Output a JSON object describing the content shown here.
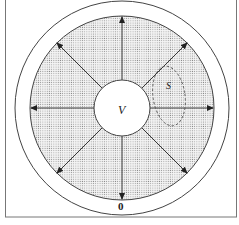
{
  "diagram": {
    "type": "concentric-circle-flux-diagram",
    "labels": {
      "inner_volume": "V",
      "surface": "S",
      "outer_boundary": "0"
    },
    "colors": {
      "stroke": "#333333",
      "shading_dot": "#888888",
      "background": "#ffffff",
      "frame": "#777777"
    },
    "arrows": {
      "count": 8,
      "directions_deg": [
        0,
        45,
        90,
        135,
        180,
        225,
        270,
        315
      ]
    }
  }
}
